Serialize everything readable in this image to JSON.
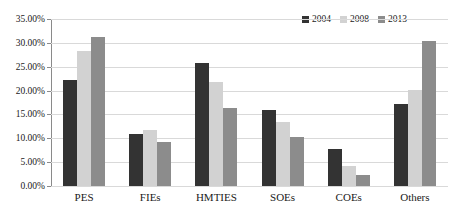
{
  "chart_data": {
    "type": "bar",
    "title": "",
    "xlabel": "",
    "ylabel": "",
    "categories": [
      "PES",
      "FIEs",
      "HMTIES",
      "SOEs",
      "COEs",
      "Others"
    ],
    "series": [
      {
        "name": "2004",
        "color": "#333333",
        "values": [
          22.3,
          11.0,
          25.8,
          16.0,
          7.7,
          17.1
        ]
      },
      {
        "name": "2008",
        "color": "#d2d2d2",
        "values": [
          28.4,
          11.7,
          21.8,
          13.5,
          4.1,
          20.2
        ]
      },
      {
        "name": "2013",
        "color": "#8c8c8c",
        "values": [
          31.2,
          9.3,
          16.4,
          10.2,
          2.3,
          30.4
        ]
      }
    ],
    "ylim": [
      0,
      35
    ],
    "ytick_values": [
      0,
      5,
      10,
      15,
      20,
      25,
      30,
      35
    ],
    "ytick_labels": [
      "0.00%",
      "5.00%",
      "10.00%",
      "15.00%",
      "20.00%",
      "25.00%",
      "30.00%",
      "35.00%"
    ],
    "grid": true,
    "grid_axis": "y",
    "legend_position": "top-right",
    "legend_entries": [
      "2004",
      "2008",
      "2013"
    ],
    "annotations": []
  },
  "colors": {
    "background": "#ffffff",
    "gridline": "#d9d9d9",
    "axis": "#6e6e6e",
    "text": "#1a1a1a",
    "series_2004": "#333333",
    "series_2008": "#d2d2d2",
    "series_2013": "#8c8c8c"
  }
}
